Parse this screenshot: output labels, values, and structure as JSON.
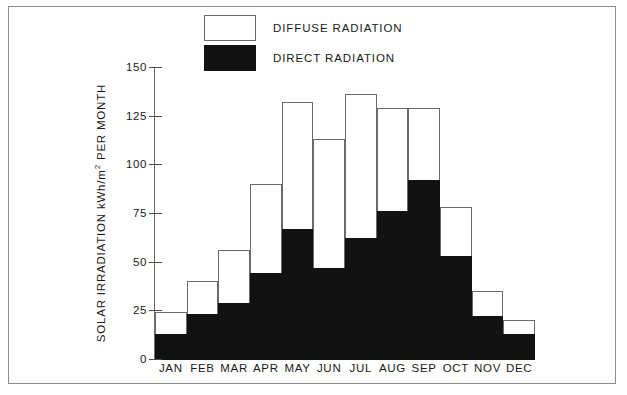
{
  "chart_data": {
    "type": "bar",
    "title": "",
    "subtitle": "",
    "xlabel": "",
    "ylabel": "SOLAR IRRADIATION kWh/m2 PER MONTH",
    "ylabel_parts": {
      "pre": "SOLAR IRRADIATION  kWh/m",
      "sup": "2",
      "post": " PER MONTH"
    },
    "categories": [
      "JAN",
      "FEB",
      "MAR",
      "APR",
      "MAY",
      "JUN",
      "JUL",
      "AUG",
      "SEP",
      "OCT",
      "NOV",
      "DEC"
    ],
    "series": [
      {
        "name": "DIRECT RADIATION",
        "color": "#121212",
        "values": [
          13,
          23,
          29,
          44,
          67,
          47,
          62,
          76,
          92,
          53,
          22,
          13
        ]
      },
      {
        "name": "DIFFUSE RADIATION",
        "color": "#ffffff",
        "values": [
          11,
          17,
          27,
          46,
          65,
          66,
          74,
          53,
          37,
          25,
          13,
          7
        ]
      }
    ],
    "totals": [
      24,
      40,
      56,
      90,
      132,
      113,
      136,
      129,
      129,
      78,
      35,
      20
    ],
    "stacked": true,
    "ylim": [
      0,
      150
    ],
    "yticks": [
      0,
      25,
      50,
      75,
      100,
      125,
      150
    ],
    "ytick_labels": [
      "0",
      "25",
      "50",
      "75",
      "100",
      "125",
      "150"
    ],
    "grid": false,
    "legend_position": "top-center",
    "legend": [
      {
        "label": "DIFFUSE RADIATION",
        "swatch": "white"
      },
      {
        "label": "DIRECT RADIATION",
        "swatch": "black"
      }
    ]
  },
  "colors": {
    "frame": "#8c8c8c",
    "axis": "#6b6b6b",
    "direct": "#121212",
    "diffuse": "#ffffff",
    "text": "#1a1a1a",
    "background": "#ffffff"
  }
}
